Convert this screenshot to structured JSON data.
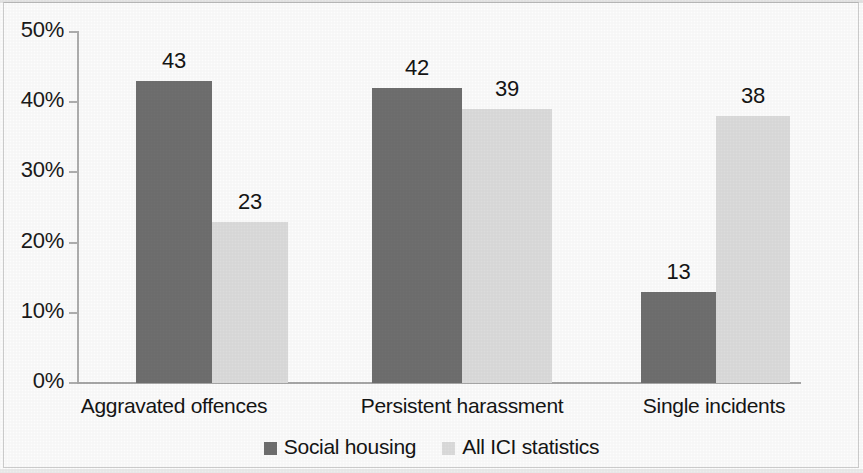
{
  "chart_data": {
    "type": "bar",
    "title": "",
    "subtitle": "",
    "xlabel": "",
    "ylabel": "",
    "categories": [
      "Aggravated offences",
      "Persistent harassment",
      "Single incidents"
    ],
    "series": [
      {
        "name": "Social housing",
        "color": "#6f6f6f",
        "values": [
          43,
          42,
          13
        ]
      },
      {
        "name": "All ICI statistics",
        "color": "#dcdcdc",
        "values": [
          23,
          39,
          38
        ]
      }
    ],
    "ylim": [
      0,
      50
    ],
    "y_ticks": [
      0,
      10,
      20,
      30,
      40,
      50
    ],
    "y_tick_labels": [
      "0%",
      "10%",
      "20%",
      "30%",
      "40%",
      "50%"
    ],
    "grid": false,
    "legend_position": "bottom",
    "value_labels": [
      {
        "group": "Aggravated offences",
        "series": "Social housing",
        "text": "43"
      },
      {
        "group": "Aggravated offences",
        "series": "All ICI statistics",
        "text": "23"
      },
      {
        "group": "Persistent harassment",
        "series": "Social housing",
        "text": "42"
      },
      {
        "group": "Persistent harassment",
        "series": "All ICI statistics",
        "text": "39"
      },
      {
        "group": "Single incidents",
        "series": "Social housing",
        "text": "13"
      },
      {
        "group": "Single incidents",
        "series": "All ICI statistics",
        "text": "38"
      }
    ]
  },
  "axis": {
    "y_tick_labels": [
      "50%",
      "40%",
      "30%",
      "20%",
      "10%",
      "0%"
    ]
  },
  "categories": {
    "c0": "Aggravated offences",
    "c1": "Persistent harassment",
    "c2": "Single incidents"
  },
  "values": {
    "g0s0": "43",
    "g0s1": "23",
    "g1s0": "42",
    "g1s1": "39",
    "g2s0": "13",
    "g2s1": "38"
  },
  "legend": {
    "items": [
      {
        "label": "Social housing",
        "color": "#6f6f6f"
      },
      {
        "label": "All ICI statistics",
        "color": "#dcdcdc"
      }
    ]
  }
}
